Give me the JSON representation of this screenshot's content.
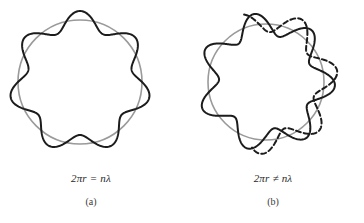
{
  "figure": {
    "background_color": "#ffffff",
    "width": 364,
    "height": 223
  },
  "colors": {
    "orbit_circle": "#9a9a9a",
    "wave": "#1c1c1c",
    "wave_dashed": "#1c1c1c",
    "caption_text": "#2a2a2a",
    "label_text": "#3a3a3a"
  },
  "panels": [
    {
      "id": "a",
      "name": "allowed-orbit",
      "equation": "2πr = nλ",
      "label": "(a)",
      "description": "Standing wave closes on itself; whole number of wavelengths fits the circumference",
      "circle": {
        "cx": 80,
        "cy": 82,
        "r": 62
      },
      "wave": {
        "lobes": 7,
        "amplitude": 9,
        "phase_deg": 0,
        "closed": true,
        "dashed_overlay": false
      }
    },
    {
      "id": "b",
      "name": "forbidden-orbit",
      "equation": "2πr ≠ nλ",
      "label": "(b)",
      "description": "Wave does not close on itself; second pass is out of phase and shown dashed with a free tail",
      "circle": {
        "cx": 84,
        "cy": 82,
        "r": 58
      },
      "wave": {
        "lobes": 7,
        "amplitude": 11,
        "phase_deg": 0,
        "closed": false,
        "dashed_overlay": true,
        "overlay_phase_offset_deg": 26,
        "overlay_dash_pattern": "5 3",
        "tail_extends_beyond_circle": true
      }
    }
  ],
  "chart_data": {
    "type": "line",
    "xlabel": "",
    "ylabel": "",
    "series": [
      {
        "name": "orbit-circle-a",
        "panel": "a",
        "kind": "circle",
        "cx": 80,
        "cy": 82,
        "r": 62,
        "color": "#9a9a9a"
      },
      {
        "name": "standing-wave-a",
        "panel": "a",
        "kind": "polar-sinusoid",
        "lobes": 7,
        "amplitude": 9,
        "base_radius": 62,
        "sweep_deg": 360,
        "color": "#1c1c1c",
        "closed": true
      },
      {
        "name": "orbit-circle-b",
        "panel": "b",
        "kind": "circle",
        "cx": 84,
        "cy": 82,
        "r": 58,
        "color": "#9a9a9a"
      },
      {
        "name": "standing-wave-b-solid",
        "panel": "b",
        "kind": "polar-sinusoid",
        "lobes": 7,
        "amplitude": 11,
        "base_radius": 58,
        "sweep_deg": 360,
        "color": "#1c1c1c",
        "closed": false
      },
      {
        "name": "standing-wave-b-dashed",
        "panel": "b",
        "kind": "polar-sinusoid",
        "lobes": 7,
        "amplitude": 11,
        "base_radius": 58,
        "sweep_deg": 210,
        "phase_offset_deg": 26,
        "color": "#1c1c1c",
        "dash": "5 3",
        "closed": false
      }
    ],
    "annotations": [
      {
        "name": "equation-a",
        "text": "2πr = nλ",
        "panel": "a"
      },
      {
        "name": "label-a",
        "text": "(a)",
        "panel": "a"
      },
      {
        "name": "equation-b",
        "text": "2πr ≠ nλ",
        "panel": "b"
      },
      {
        "name": "label-b",
        "text": "(b)",
        "panel": "b"
      }
    ],
    "grid": false,
    "legend": "none"
  }
}
